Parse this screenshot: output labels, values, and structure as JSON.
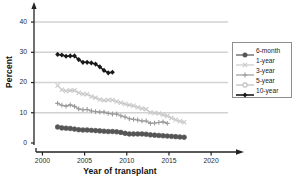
{
  "chart_data": {
    "type": "line",
    "title": "",
    "xlabel": "Year of transplant",
    "ylabel": "Percent",
    "xlim": [
      1999,
      2022
    ],
    "ylim": [
      0,
      43
    ],
    "xticks": [
      2000,
      2005,
      2010,
      2015,
      2020
    ],
    "yticks": [
      0,
      10,
      20,
      30,
      40
    ],
    "grid": "horizontal",
    "legend_position": "right",
    "series": [
      {
        "name": "6-month",
        "marker": "filled-circle",
        "color": "#555555",
        "x": [
          2001.8,
          2002.3,
          2002.8,
          2003.3,
          2003.8,
          2004.3,
          2004.8,
          2005.3,
          2005.8,
          2006.3,
          2006.8,
          2007.3,
          2007.8,
          2008.3,
          2008.8,
          2009.3,
          2009.8,
          2010.3,
          2010.8,
          2011.3,
          2011.8,
          2012.3,
          2012.8,
          2013.3,
          2013.8,
          2014.3,
          2014.8,
          2015.3,
          2015.8,
          2016.3,
          2016.8
        ],
        "values": [
          5.3,
          5.0,
          4.9,
          4.8,
          4.6,
          4.4,
          4.3,
          4.3,
          4.2,
          4.1,
          4.0,
          3.9,
          3.8,
          3.8,
          3.7,
          3.5,
          3.2,
          3.0,
          3.0,
          3.0,
          3.0,
          2.9,
          2.7,
          2.6,
          2.5,
          2.4,
          2.3,
          2.2,
          2.1,
          2.0,
          1.9
        ]
      },
      {
        "name": "1-year",
        "marker": "x-cross",
        "color": "#c9c9c9",
        "x": [
          2001.8,
          2002.3,
          2002.8,
          2003.3,
          2003.8,
          2004.3,
          2004.8,
          2005.3,
          2005.8,
          2006.3,
          2006.8,
          2007.3,
          2007.8,
          2008.3,
          2008.8,
          2009.3,
          2009.8,
          2010.3,
          2010.8,
          2011.3,
          2011.8,
          2012.3,
          2012.8,
          2013.3,
          2013.8,
          2014.3,
          2014.8,
          2015.3,
          2015.8,
          2016.3,
          2016.8
        ],
        "values": [
          19.0,
          17.6,
          17.2,
          17.4,
          17.4,
          16.6,
          16.2,
          16.1,
          15.4,
          15.0,
          14.4,
          14.1,
          14.2,
          14.2,
          13.7,
          13.3,
          12.9,
          12.6,
          12.3,
          11.8,
          11.4,
          11.2,
          10.1,
          9.9,
          9.8,
          9.3,
          8.9,
          8.3,
          7.7,
          7.2,
          6.9
        ]
      },
      {
        "name": "3-year",
        "marker": "plus",
        "color": "#9b9b9b",
        "x": [
          2001.8,
          2002.3,
          2002.8,
          2003.3,
          2003.8,
          2004.3,
          2004.8,
          2005.3,
          2005.8,
          2006.3,
          2006.8,
          2007.3,
          2007.8,
          2008.3,
          2008.8,
          2009.3,
          2009.8,
          2010.3,
          2010.8,
          2011.3,
          2011.8,
          2012.3,
          2012.8,
          2013.3,
          2013.8,
          2014.3,
          2014.8
        ],
        "values": [
          13.1,
          12.5,
          12.2,
          12.6,
          12.1,
          11.3,
          11.0,
          11.1,
          10.6,
          10.4,
          10.2,
          10.2,
          9.8,
          9.6,
          9.6,
          9.0,
          8.6,
          8.0,
          7.8,
          7.6,
          7.3,
          7.3,
          6.5,
          6.6,
          6.8,
          7.0,
          6.5
        ]
      },
      {
        "name": "5-year",
        "marker": "open-circle",
        "color": "#bdbdbd",
        "x": [
          2001.8,
          2002.3,
          2002.8,
          2003.3,
          2003.8,
          2004.3,
          2004.8,
          2005.3,
          2005.8,
          2006.3,
          2006.8,
          2007.3,
          2007.8,
          2008.3,
          2008.8,
          2009.3,
          2009.8,
          2010.3,
          2010.8,
          2011.3,
          2011.8,
          2012.3,
          2012.8,
          2013.3,
          2013.8,
          2014.3,
          2014.8,
          2015.3,
          2015.8,
          2016.3,
          2016.8
        ],
        "values": [
          5.3,
          5.0,
          4.9,
          4.8,
          4.6,
          4.4,
          4.3,
          4.3,
          4.2,
          4.1,
          4.0,
          3.9,
          3.8,
          3.8,
          3.7,
          3.5,
          3.2,
          3.0,
          3.0,
          3.0,
          3.0,
          2.9,
          2.7,
          2.6,
          2.5,
          2.4,
          2.3,
          2.2,
          2.1,
          2.0,
          1.9
        ]
      },
      {
        "name": "10-year",
        "marker": "filled-diamond",
        "color": "#1a1a1a",
        "x": [
          2001.8,
          2002.3,
          2002.8,
          2003.3,
          2003.8,
          2004.3,
          2004.8,
          2005.3,
          2005.8,
          2006.3,
          2006.8,
          2007.3,
          2007.8,
          2008.3
        ],
        "values": [
          29.3,
          29.1,
          28.7,
          28.8,
          28.8,
          27.6,
          26.7,
          26.7,
          26.5,
          26.1,
          25.2,
          24.0,
          23.2,
          23.4
        ]
      }
    ]
  },
  "axes": {
    "ylabel": "Percent",
    "xlabel": "Year of transplant",
    "yticks": [
      "0",
      "10",
      "20",
      "30",
      "40"
    ],
    "xticks": [
      "2000",
      "2005",
      "2010",
      "2015",
      "2020"
    ]
  },
  "legend": {
    "items": [
      {
        "label": "6-month",
        "marker": "filled-circle-marker",
        "color": "#555555"
      },
      {
        "label": "1-year",
        "marker": "x-cross-marker",
        "color": "#c9c9c9"
      },
      {
        "label": "3-year",
        "marker": "plus-marker",
        "color": "#9b9b9b"
      },
      {
        "label": "5-year",
        "marker": "open-circle-marker",
        "color": "#bdbdbd"
      },
      {
        "label": "10-year",
        "marker": "filled-diamond-marker",
        "color": "#1a1a1a"
      }
    ]
  }
}
